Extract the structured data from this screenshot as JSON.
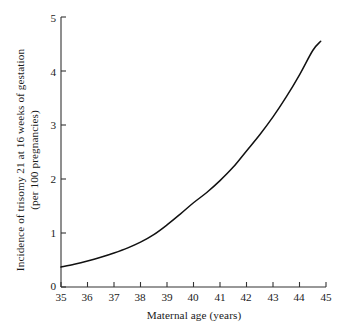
{
  "chart_data": {
    "type": "line",
    "title": "",
    "xlabel": "Maternal age (years)",
    "ylabel_lines": [
      "Incidence of trisomy 21 at 16 weeks of gestation",
      "(per 100 pregnancies)"
    ],
    "ylabel": "Incidence of trisomy 21 at 16 weeks of gestation (per 100 pregnancies)",
    "xlim": [
      35,
      45
    ],
    "ylim": [
      0,
      5
    ],
    "xticks": [
      35,
      36,
      37,
      38,
      39,
      40,
      41,
      42,
      43,
      44,
      45
    ],
    "yticks": [
      0,
      1,
      2,
      3,
      4,
      5
    ],
    "xtick_labels": [
      "35",
      "36",
      "37",
      "38",
      "39",
      "40",
      "41",
      "42",
      "43",
      "44",
      "45"
    ],
    "ytick_labels": [
      "0",
      "1",
      "2",
      "3",
      "4",
      "5"
    ],
    "grid": false,
    "legend": null,
    "tick_direction": "in",
    "series": [
      {
        "name": "Incidence of trisomy 21",
        "color": "#111111",
        "x": [
          35.0,
          35.5,
          36.0,
          36.5,
          37.0,
          37.5,
          38.0,
          38.5,
          39.0,
          39.5,
          40.0,
          40.5,
          41.0,
          41.5,
          42.0,
          42.5,
          43.0,
          43.5,
          44.0,
          44.5,
          44.8
        ],
        "values": [
          0.37,
          0.42,
          0.48,
          0.55,
          0.63,
          0.72,
          0.83,
          0.97,
          1.15,
          1.35,
          1.56,
          1.75,
          1.97,
          2.22,
          2.52,
          2.82,
          3.15,
          3.52,
          3.93,
          4.38,
          4.55
        ]
      }
    ]
  },
  "axes": {
    "x_axis_name": "x-axis",
    "y_axis_name": "y-axis"
  }
}
